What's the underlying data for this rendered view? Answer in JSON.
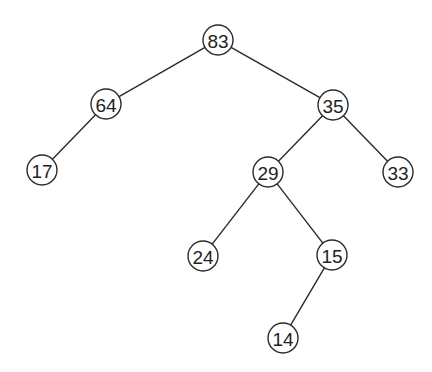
{
  "diagram": {
    "type": "binary-tree",
    "node_radius": 15,
    "colors": {
      "stroke": "#2a2a2a",
      "fill": "#ffffff",
      "text": "#222222",
      "background": "#ffffff"
    },
    "nodes": [
      {
        "id": "n83",
        "label": "83",
        "x": 218,
        "y": 40
      },
      {
        "id": "n64",
        "label": "64",
        "x": 106,
        "y": 104
      },
      {
        "id": "n35",
        "label": "35",
        "x": 333,
        "y": 105
      },
      {
        "id": "n17",
        "label": "17",
        "x": 42,
        "y": 170
      },
      {
        "id": "n29",
        "label": "29",
        "x": 268,
        "y": 172
      },
      {
        "id": "n33",
        "label": "33",
        "x": 398,
        "y": 172
      },
      {
        "id": "n24",
        "label": "24",
        "x": 203,
        "y": 256
      },
      {
        "id": "n15",
        "label": "15",
        "x": 332,
        "y": 255
      },
      {
        "id": "n14",
        "label": "14",
        "x": 283,
        "y": 338
      }
    ],
    "edges": [
      {
        "from": "n83",
        "to": "n64"
      },
      {
        "from": "n83",
        "to": "n35"
      },
      {
        "from": "n64",
        "to": "n17"
      },
      {
        "from": "n35",
        "to": "n29"
      },
      {
        "from": "n35",
        "to": "n33"
      },
      {
        "from": "n29",
        "to": "n24"
      },
      {
        "from": "n29",
        "to": "n15"
      },
      {
        "from": "n15",
        "to": "n14"
      }
    ]
  }
}
